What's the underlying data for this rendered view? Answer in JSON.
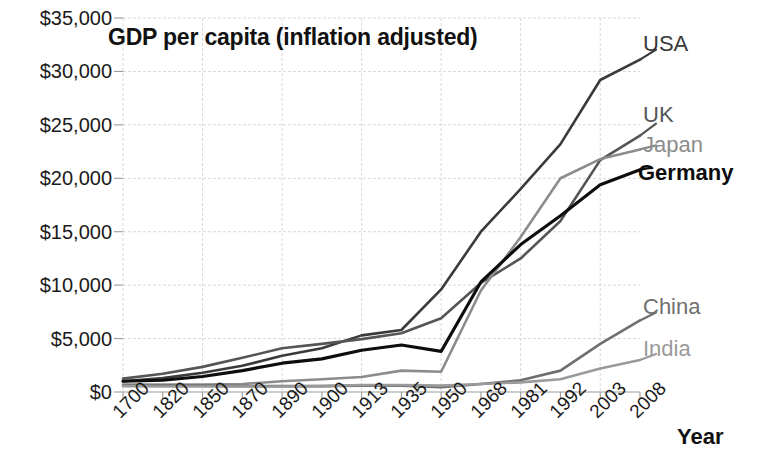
{
  "chart_data": {
    "type": "line",
    "title": "GDP per capita (inflation adjusted)",
    "xlabel": "Year",
    "ylabel": "",
    "categories": [
      "1700",
      "1820",
      "1850",
      "1870",
      "1890",
      "1900",
      "1913",
      "1935",
      "1950",
      "1968",
      "1981",
      "1992",
      "2003",
      "2008"
    ],
    "ytick_labels": [
      "$0",
      "$5,000",
      "$10,000",
      "$15,000",
      "$20,000",
      "$25,000",
      "$30,000",
      "$35,000"
    ],
    "ytick_values": [
      0,
      5000,
      10000,
      15000,
      20000,
      25000,
      30000,
      35000
    ],
    "ylim": [
      0,
      35000
    ],
    "grid": true,
    "legend_position": "right-of-lines (direct labels)",
    "series": [
      {
        "name": "USA",
        "color": "#3a3a3a",
        "values": [
          1000,
          1300,
          1800,
          2450,
          3400,
          4100,
          5300,
          5800,
          9600,
          15000,
          19000,
          23200,
          29200,
          31100
        ]
      },
      {
        "name": "UK",
        "color": "#555555",
        "values": [
          1250,
          1700,
          2350,
          3200,
          4100,
          4500,
          4950,
          5500,
          6900,
          10200,
          12500,
          16000,
          21700,
          24000
        ]
      },
      {
        "name": "Japan",
        "color": "#8c8c8c",
        "values": [
          700,
          700,
          700,
          750,
          1000,
          1200,
          1400,
          2000,
          1900,
          9500,
          14500,
          20000,
          21800,
          22700
        ]
      },
      {
        "name": "Germany",
        "color": "#0d0d0d",
        "values": [
          1000,
          1100,
          1450,
          2000,
          2700,
          3100,
          3900,
          4400,
          3800,
          10300,
          13800,
          16500,
          19400,
          20800
        ]
      },
      {
        "name": "China",
        "color": "#6f6f6f",
        "values": [
          600,
          600,
          600,
          550,
          550,
          550,
          600,
          600,
          450,
          750,
          1100,
          2000,
          4500,
          6700
        ]
      },
      {
        "name": "India",
        "color": "#9a9a9a",
        "values": [
          550,
          520,
          520,
          520,
          520,
          550,
          650,
          650,
          600,
          750,
          900,
          1200,
          2200,
          3000
        ]
      }
    ]
  },
  "labels": {
    "usa": "USA",
    "uk": "UK",
    "japan": "Japan",
    "germany": "Germany",
    "china": "China",
    "india": "India"
  },
  "colors": {
    "usa": "#3a3a3a",
    "uk": "#555555",
    "japan": "#8c8c8c",
    "germany": "#0d0d0d",
    "china": "#6f6f6f",
    "india": "#9a9a9a",
    "grid": "#d8d8d8",
    "axis": "#9b9b9b",
    "text": "#1a1a1a"
  }
}
